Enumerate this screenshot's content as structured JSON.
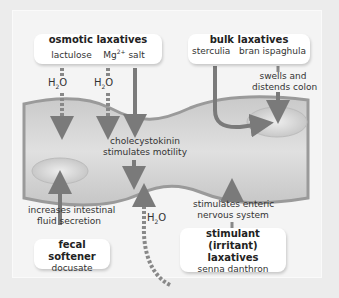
{
  "boxes": {
    "osmotic": {
      "title": "osmotic laxatives",
      "items": [
        "lactulose",
        "Mg",
        "2+",
        " salt"
      ]
    },
    "bulk": {
      "title": "bulk laxatives",
      "items": [
        "sterculia",
        "bran ispaghula"
      ]
    },
    "fecal": {
      "title": "fecal softener",
      "items": [
        "docusate"
      ]
    },
    "stimulant": {
      "title_line1": "stimulant (irritant)",
      "title_line2": "laxatives",
      "items": [
        "senna danthron"
      ]
    }
  },
  "labels": {
    "water_1": {
      "h": "H",
      "sub": "2",
      "o": "O"
    },
    "water_2": {
      "h": "H",
      "sub": "2",
      "o": "O"
    },
    "water_3": {
      "h": "H",
      "sub": "2",
      "o": "O"
    },
    "swells_1": "swells and",
    "swells_2": "distends colon",
    "cck_1": "cholecystokinin",
    "cck_2": "stimulates motility",
    "secretion_1": "increases intestinal",
    "secretion_2": "fluid secretion",
    "enteric_1": "stimulates enteric",
    "enteric_2": "nervous system"
  },
  "colors": {
    "background": "#ececec",
    "panel": "#f4f4f4",
    "colon_fill": "#d3d3d3",
    "colon_edge": "#9a9a9a",
    "arrow": "#7a7a7a"
  }
}
